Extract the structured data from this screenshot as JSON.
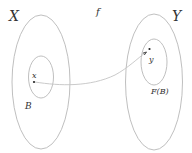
{
  "diagram": {
    "labels": {
      "domain": "X",
      "codomain": "Y",
      "function": "f",
      "point_in_domain": "x",
      "point_in_codomain": "y",
      "subset": "B",
      "image": "F(B)"
    },
    "colors": {
      "ellipse_stroke": "#b8b8b8",
      "curve_stroke": "#c4c4c4",
      "point_fill": "#222222",
      "text": "#333333"
    },
    "shapes": {
      "set_X": {
        "cx": 41,
        "cy": 82,
        "rx": 29,
        "ry": 67
      },
      "subset_B": {
        "cx": 41,
        "cy": 77,
        "rx": 12.5,
        "ry": 21
      },
      "set_Y": {
        "cx": 154,
        "cy": 82,
        "rx": 28.5,
        "ry": 68
      },
      "image_FB": {
        "cx": 154,
        "cy": 62,
        "rx": 13,
        "ry": 23
      },
      "point_x": {
        "x": 34,
        "y": 82
      },
      "point_y": {
        "x": 149,
        "y": 49
      }
    }
  }
}
